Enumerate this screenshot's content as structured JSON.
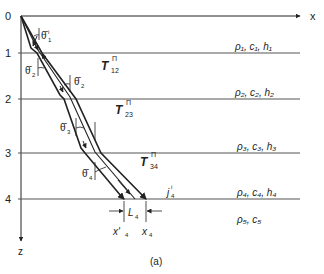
{
  "figure": {
    "caption": "(a)",
    "axes": {
      "x_label": "x",
      "z_label": "z",
      "depth_ticks": [
        "0",
        "1",
        "2",
        "3",
        "4"
      ]
    },
    "layers": [
      {
        "label": "ρ₁, c₁, h₁"
      },
      {
        "label": "ρ₂, c₂, h₂"
      },
      {
        "label": "ρ₃, c₃, h₃"
      },
      {
        "label": "ρ₄, c₄, h₄"
      },
      {
        "label": "ρ₅, c₅"
      }
    ],
    "transmission_labels": [
      {
        "base": "T",
        "sup": "Π",
        "sub": "12"
      },
      {
        "base": "T",
        "sup": "Π",
        "sub": "23"
      },
      {
        "base": "T",
        "sup": "Π",
        "sub": "34"
      }
    ],
    "angle_labels": [
      {
        "symbol": "θ̄",
        "sub": "1",
        "sup": "i"
      },
      {
        "symbol": "θ̄",
        "sub": "2",
        "sup": ""
      },
      {
        "symbol": "θ̄",
        "sub": "2",
        "sup": ""
      },
      {
        "symbol": "θ̄",
        "sub": "3",
        "sup": ""
      },
      {
        "symbol": "θ̄",
        "sub": "4",
        "sup": ""
      }
    ],
    "bottom_labels": {
      "L": "L",
      "L_sub": "4",
      "x_prime": "x'",
      "x_prime_sub": "4",
      "x": "x",
      "x_sub": "4",
      "j": "j",
      "j_sub": "4",
      "j_sup": "i"
    },
    "colors": {
      "line": "#222222",
      "layer_line": "#555555",
      "background": "#ffffff"
    }
  }
}
